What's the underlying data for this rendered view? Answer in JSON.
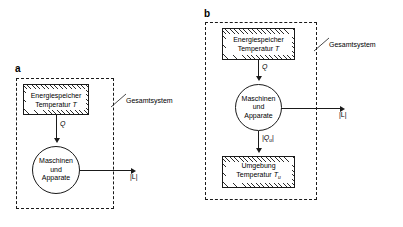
{
  "figure": {
    "panels": [
      {
        "letter": "a",
        "boundary_label": "Gesamtsystem",
        "nodes": [
          {
            "name": "energy-store",
            "shape": "hatched-rectangle",
            "lines": [
              "Energiespeicher",
              "Temperatur "
            ],
            "symbol": "T",
            "symbol_sub": ""
          },
          {
            "name": "machines",
            "shape": "circle",
            "lines": [
              "Maschinen",
              "und",
              "Apparate"
            ]
          }
        ],
        "flows": [
          {
            "name": "heat-in",
            "label": "Q",
            "label_sub": "",
            "direction": "down"
          },
          {
            "name": "work-out",
            "label": "|L|",
            "direction": "right"
          }
        ]
      },
      {
        "letter": "b",
        "boundary_label": "Gesamtsystem",
        "nodes": [
          {
            "name": "energy-store",
            "shape": "hatched-rectangle",
            "lines": [
              "Energiespeicher",
              "Temperatur "
            ],
            "symbol": "T",
            "symbol_sub": ""
          },
          {
            "name": "machines",
            "shape": "circle",
            "lines": [
              "Maschinen",
              "und",
              "Apparate"
            ]
          },
          {
            "name": "environment",
            "shape": "hatched-rectangle",
            "lines": [
              "Umgebung",
              "Temperatur "
            ],
            "symbol": "T",
            "symbol_sub": "u"
          }
        ],
        "flows": [
          {
            "name": "heat-in",
            "label": "Q",
            "direction": "down"
          },
          {
            "name": "work-out",
            "label": "|L|",
            "direction": "right"
          },
          {
            "name": "heat-reject",
            "label": "|Q",
            "label_sub": "u",
            "label_tail": "|",
            "direction": "down"
          }
        ]
      }
    ],
    "colors": {
      "line": "#1a1a1a",
      "background": "#ffffff",
      "hatch": "#2b2b2b"
    }
  }
}
